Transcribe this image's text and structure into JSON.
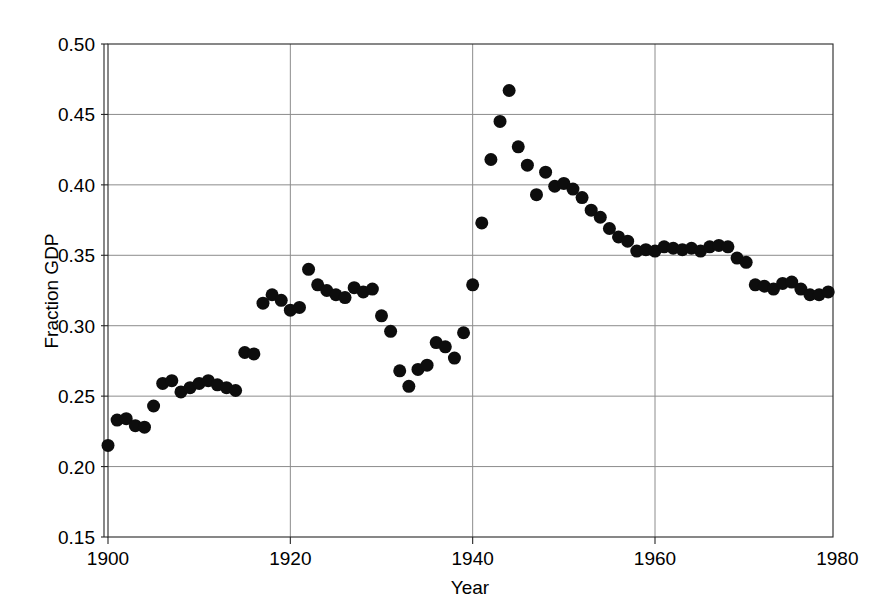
{
  "chart_data": {
    "type": "scatter",
    "title": "",
    "xlabel": "Year",
    "ylabel": "Fraction GDP",
    "xlim": [
      1900,
      1991
    ],
    "ylim": [
      0.15,
      0.5
    ],
    "xticks": [
      1900,
      1920,
      1940,
      1960,
      1980
    ],
    "yticks": [
      0.15,
      0.2,
      0.25,
      0.3,
      0.35,
      0.4,
      0.45,
      0.5
    ],
    "xtick_labels": [
      "1900",
      "1920",
      "1940",
      "1960",
      "1980"
    ],
    "ytick_labels": [
      "0.15",
      "0.20",
      "0.25",
      "0.30",
      "0.35",
      "0.40",
      "0.45",
      "0.50"
    ],
    "grid": true,
    "legend": null,
    "marker": "filled-circle",
    "marker_color": "#0d0d0d",
    "marker_size_px": 13,
    "series": [
      {
        "name": "Fraction GDP",
        "x": [
          1900,
          1901,
          1902,
          1903,
          1904,
          1905,
          1906,
          1907,
          1908,
          1909,
          1910,
          1911,
          1912,
          1913,
          1914,
          1915,
          1916,
          1917,
          1918,
          1919,
          1920,
          1921,
          1922,
          1923,
          1924,
          1925,
          1926,
          1927,
          1928,
          1929,
          1930,
          1931,
          1932,
          1933,
          1934,
          1935,
          1936,
          1937,
          1938,
          1939,
          1940,
          1941,
          1942,
          1943,
          1944,
          1945,
          1946,
          1947,
          1948,
          1949,
          1950,
          1951,
          1952,
          1953,
          1954,
          1955,
          1956,
          1957,
          1958,
          1959,
          1960,
          1961,
          1962,
          1963,
          1964,
          1965,
          1966,
          1967,
          1968,
          1969,
          1970,
          1971,
          1972,
          1973,
          1974,
          1975,
          1976,
          1977,
          1978,
          1979,
          1980,
          1981,
          1982,
          1983,
          1984,
          1985,
          1986,
          1987,
          1988,
          1989,
          1990,
          1991
        ],
        "y": [
          0.215,
          0.233,
          0.234,
          0.229,
          0.228,
          0.243,
          0.259,
          0.261,
          0.253,
          0.256,
          0.259,
          0.261,
          0.258,
          0.256,
          0.254,
          0.281,
          0.28,
          0.316,
          0.322,
          0.318,
          0.311,
          0.313,
          0.34,
          0.329,
          0.325,
          0.322,
          0.32,
          0.327,
          0.324,
          0.326,
          0.307,
          0.296,
          0.268,
          0.257,
          0.269,
          0.272,
          0.288,
          0.285,
          0.277,
          0.295,
          0.329,
          0.373,
          0.418,
          0.445,
          0.467,
          0.427,
          0.414,
          0.393,
          0.409,
          0.399,
          0.401,
          0.397,
          0.391,
          0.382,
          0.377,
          0.369,
          0.363,
          0.36,
          0.353,
          0.354,
          0.353,
          0.356,
          0.355,
          0.354,
          0.355,
          0.353,
          0.356,
          0.357,
          0.356,
          0.348,
          0.345,
          0.329,
          0.328,
          0.326,
          0.33,
          0.331,
          0.326,
          0.322,
          0.322,
          0.324,
          0.327,
          0.326,
          0.321,
          0.316,
          0.324,
          0.323,
          0.323,
          0.321,
          0.32,
          0.32,
          0.32,
          0.32
        ]
      }
    ]
  }
}
